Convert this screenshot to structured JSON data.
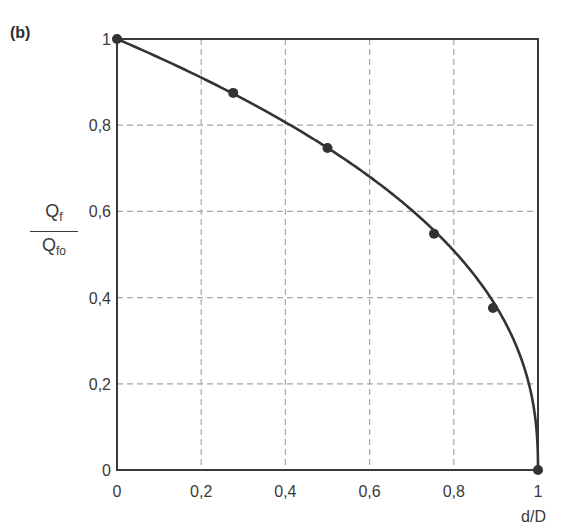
{
  "panel_label": "(b)",
  "chart_data": {
    "type": "line",
    "title": "",
    "panel": "(b)",
    "xlabel": "d/D",
    "ylabel": {
      "numerator": "Q",
      "numerator_sub": "f",
      "denominator": "Q",
      "denominator_sub": "fo"
    },
    "xlim": [
      0,
      1
    ],
    "ylim": [
      0,
      1
    ],
    "grid": true,
    "grid_style": "dashed",
    "x_ticks": [
      0,
      0.2,
      0.4,
      0.6,
      0.8,
      1
    ],
    "x_tick_labels": [
      "0",
      "0,2",
      "0,4",
      "0,6",
      "0,8",
      "1"
    ],
    "y_ticks": [
      0,
      0.2,
      0.4,
      0.6,
      0.8,
      1
    ],
    "y_tick_labels": [
      "0",
      "0,2",
      "0,4",
      "0,6",
      "0,8",
      "1"
    ],
    "series": [
      {
        "name": "Qf/Qfo",
        "curve_exponent": 0.42,
        "points": [
          {
            "x": 0,
            "y": 1
          },
          {
            "x": 0.276,
            "y": 0.875
          },
          {
            "x": 0.5,
            "y": 0.747
          },
          {
            "x": 0.753,
            "y": 0.548
          },
          {
            "x": 0.893,
            "y": 0.376
          },
          {
            "x": 1,
            "y": 0
          }
        ],
        "color": "#333333"
      }
    ]
  }
}
